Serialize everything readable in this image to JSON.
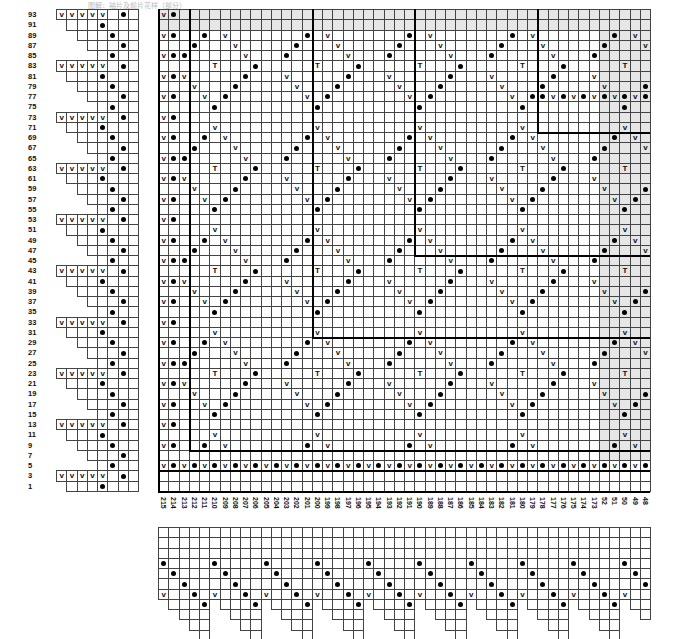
{
  "title": "图解：袖片及前片花样（部分）",
  "legend": {
    "dot": "dot-symbol",
    "v": "V",
    "t": "T"
  },
  "colors": {
    "shade": "#e6e6e6",
    "line": "#444444",
    "bold_line": "#000000"
  },
  "main_chart": {
    "origin": {
      "x": 158,
      "y": 9
    },
    "cell_w": 10.25,
    "cell_h": 10.25,
    "rows": [
      93,
      91,
      89,
      87,
      85,
      83,
      81,
      79,
      77,
      75,
      73,
      71,
      69,
      67,
      65,
      63,
      61,
      59,
      57,
      55,
      53,
      51,
      49,
      47,
      45,
      43,
      41,
      39,
      37,
      35,
      33,
      31,
      29,
      27,
      25,
      23,
      21,
      19,
      17,
      15,
      13,
      11,
      9,
      7,
      5,
      3,
      1
    ],
    "columns": [
      "215",
      "214",
      "213",
      "212",
      "211",
      "210",
      "209",
      "208",
      "207",
      "206",
      "205",
      "204",
      "203",
      "202",
      "201",
      "200",
      "199",
      "198",
      "197",
      "196",
      "195",
      "194",
      "193",
      "192",
      "191",
      "190",
      "189",
      "188",
      "187",
      "186",
      "185",
      "184",
      "183",
      "182",
      "181",
      "180",
      "179",
      "178",
      "177",
      "176",
      "175",
      "174",
      "173",
      "52",
      "51",
      "50",
      "49",
      "48"
    ],
    "motif_rows": [
      "v.",
      "..",
      "v.",
      "..",
      "v.",
      "..",
      "v.",
      "..",
      "v.",
      "..",
      "v.",
      "..",
      "v.",
      "..",
      "v.",
      "..",
      "v.",
      "..",
      "v.",
      "..",
      "v.",
      "..",
      "v.",
      "..",
      "v.",
      "..",
      "v.",
      "..",
      "v.",
      "..",
      "v.",
      "..",
      "v.",
      "..",
      "v.",
      "..",
      "v.",
      "..",
      "v.",
      "..",
      "v.",
      "..",
      "v.",
      "..",
      "v.",
      "..",
      ".."
    ],
    "row5_pattern": "v•v•v•v•v•v•v•v•v•v•v•v•v•v•v•v•v•v•v•v•v•v•v•v•",
    "row77_right": "•v•v•v•v•v•"
  },
  "left_edge_chart": {
    "rows_with_v": [
      91,
      81,
      71,
      61,
      51,
      41,
      31,
      21,
      11
    ],
    "v_count": 5
  },
  "bottom_chart": {
    "repeats": 11,
    "v_stack": [
      "v",
      "v",
      "v",
      "v",
      "v"
    ]
  }
}
